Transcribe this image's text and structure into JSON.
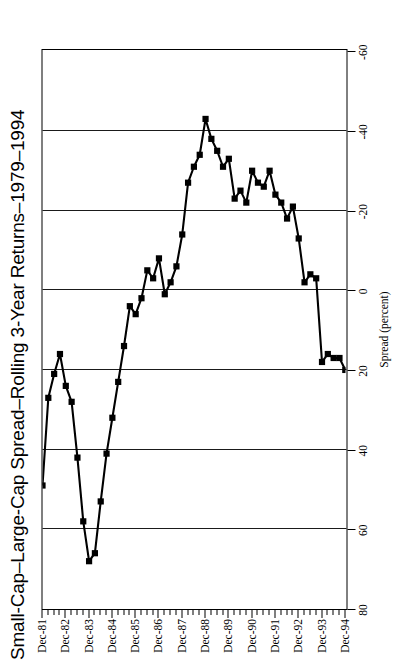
{
  "chart": {
    "title": "Small-Cap–Large-Cap Spread–Rolling 3-Year Returns–1979–1994",
    "xaxis_title": "Period Ending",
    "yaxis_title": "Spread (percent)"
  },
  "chart_data": {
    "type": "line",
    "title": "Small-Cap–Large-Cap Spread–Rolling 3-Year Returns–1979–1994",
    "xlabel": "Period Ending",
    "ylabel": "Spread (percent)",
    "ylim": [
      -60,
      80
    ],
    "yticks": [
      80,
      60,
      40,
      20,
      0,
      -20,
      -40,
      -60
    ],
    "ytick_labels": [
      "80",
      "60",
      "40",
      "20",
      "0",
      "-20",
      "-40",
      "-60"
    ],
    "grid": "vertical-gridlines-at-yticks",
    "legend": "none",
    "marker": "filled-square",
    "x_major_labels": [
      "Dec-81",
      "Dec-82",
      "Dec-83",
      "Dec-84",
      "Dec-85",
      "Dec-86",
      "Dec-87",
      "Dec-88",
      "Dec-89",
      "Dec-90",
      "Dec-91",
      "Dec-92",
      "Dec-93",
      "Dec-94"
    ],
    "x_minor_ticks_per_year": 4,
    "x_frequency": "quarterly",
    "x": [
      "Dec-81",
      "Mar-82",
      "Jun-82",
      "Sep-82",
      "Dec-82",
      "Mar-83",
      "Jun-83",
      "Sep-83",
      "Dec-83",
      "Mar-84",
      "Jun-84",
      "Sep-84",
      "Dec-84",
      "Mar-85",
      "Jun-85",
      "Sep-85",
      "Dec-85",
      "Mar-86",
      "Jun-86",
      "Sep-86",
      "Dec-86",
      "Mar-87",
      "Jun-87",
      "Sep-87",
      "Dec-87",
      "Mar-88",
      "Jun-88",
      "Sep-88",
      "Dec-88",
      "Mar-89",
      "Jun-89",
      "Sep-89",
      "Dec-89",
      "Mar-90",
      "Jun-90",
      "Sep-90",
      "Dec-90",
      "Mar-91",
      "Jun-91",
      "Sep-91",
      "Dec-91",
      "Mar-92",
      "Jun-92",
      "Sep-92",
      "Dec-92",
      "Mar-93",
      "Jun-93",
      "Sep-93",
      "Dec-93",
      "Mar-94",
      "Jun-94",
      "Sep-94",
      "Dec-94"
    ],
    "values": [
      49,
      27,
      21,
      16,
      24,
      28,
      42,
      58,
      68,
      66,
      53,
      41,
      32,
      23,
      14,
      4,
      6,
      2,
      -5,
      -3,
      -8,
      1,
      -2,
      -6,
      -14,
      -27,
      -31,
      -34,
      -43,
      -38,
      -35,
      -31,
      -33,
      -23,
      -25,
      -22,
      -30,
      -27,
      -26,
      -30,
      -24,
      -22,
      -18,
      -21,
      -13,
      -2,
      -4,
      -3,
      18,
      16,
      17,
      17,
      20
    ],
    "series": [
      {
        "name": "Small-Cap–Large-Cap Spread",
        "values": [
          49,
          27,
          21,
          16,
          24,
          28,
          42,
          58,
          68,
          66,
          53,
          41,
          32,
          23,
          14,
          4,
          6,
          2,
          -5,
          -3,
          -8,
          1,
          -2,
          -6,
          -14,
          -27,
          -31,
          -34,
          -43,
          -38,
          -35,
          -31,
          -33,
          -23,
          -25,
          -22,
          -30,
          -27,
          -26,
          -30,
          -24,
          -22,
          -18,
          -21,
          -13,
          -2,
          -4,
          -3,
          18,
          16,
          17,
          17,
          20
        ]
      }
    ],
    "max_value": 68,
    "min_value": -43
  }
}
